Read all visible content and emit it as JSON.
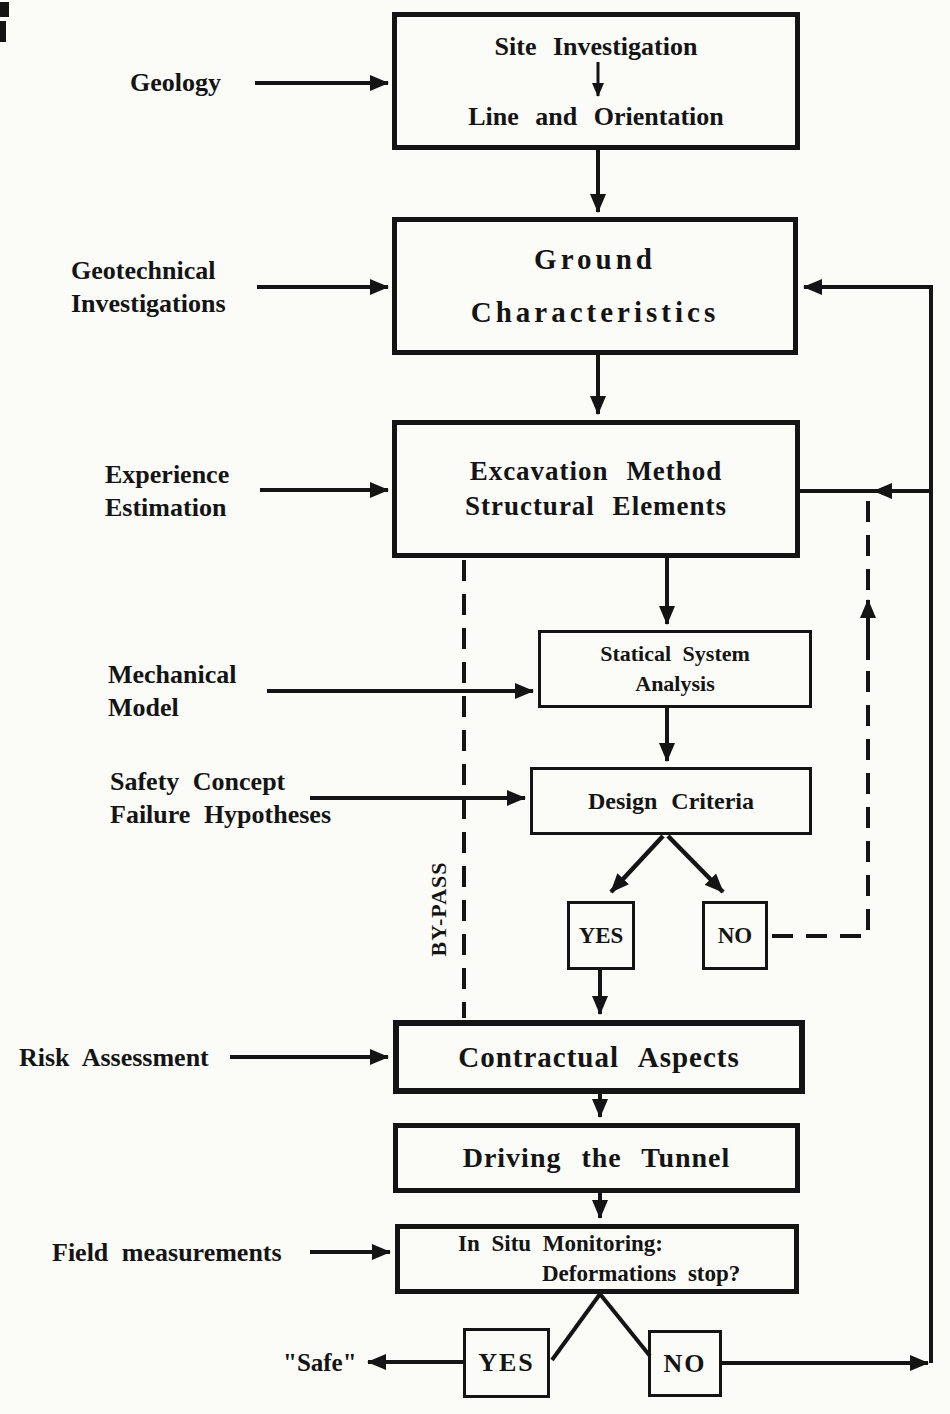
{
  "boxes": {
    "site": {
      "line1": "Site Investigation",
      "line2": "Line and Orientation"
    },
    "ground": {
      "line1": "Ground",
      "line2": "Characteristics"
    },
    "excavation": {
      "line1": "Excavation Method",
      "line2": "Structural Elements"
    },
    "statical": {
      "line1": "Statical System",
      "line2": "Analysis"
    },
    "design": {
      "label": "Design Criteria"
    },
    "design_yes": {
      "label": "YES"
    },
    "design_no": {
      "label": "NO"
    },
    "contractual": {
      "label": "Contractual Aspects"
    },
    "driving": {
      "label": "Driving the Tunnel"
    },
    "monitoring": {
      "line1": "In Situ Monitoring:",
      "line2": "Deformations stop?"
    },
    "monitoring_yes": {
      "label": "YES"
    },
    "monitoring_no": {
      "label": "NO"
    }
  },
  "side_labels": {
    "geology": {
      "line1": "Geology"
    },
    "geotechnical": {
      "line1": "Geotechnical",
      "line2": "Investigations"
    },
    "experience": {
      "line1": "Experience",
      "line2": "Estimation"
    },
    "mechanical": {
      "line1": "Mechanical",
      "line2": "Model"
    },
    "safety": {
      "line1": "Safety Concept",
      "line2": "Failure Hypotheses"
    },
    "risk": {
      "line1": "Risk Assessment"
    },
    "field": {
      "line1": "Field measurements"
    },
    "safe": {
      "line1": "\"Safe\""
    }
  },
  "annotations": {
    "bypass": "BY-PASS"
  },
  "colors": {
    "ink": "#141414",
    "paper": "#fbfbf8"
  }
}
